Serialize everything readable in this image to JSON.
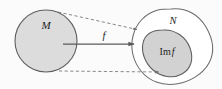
{
  "figure": {
    "background_color": "#fbfbfb",
    "labels": {
      "domain": "M",
      "codomain": "N",
      "map": "f",
      "image_prefix": "Im",
      "image_suffix": "f",
      "image_full": "Im f"
    },
    "colors": {
      "fill_gray": "#dcdcdc",
      "inner_fill_gray": "#d2d2d2",
      "stroke_dark": "#595959",
      "stroke_outline": "#6b6b6b",
      "dashed_stroke": "#7a7a7a",
      "arrow_stroke": "#5a5a5a",
      "text": "#1c1c1c"
    },
    "shapes": {
      "domain_circle": {
        "cx": 46,
        "cy": 41,
        "r": 31
      },
      "codomain_blob": "irregular-rounded-blob",
      "image_blob": "filled-inner-blob"
    },
    "connectors": {
      "solid_arrow": {
        "from_x": 63,
        "from_y": 44,
        "to_x": 136,
        "to_y": 44,
        "style": "solid"
      },
      "dashed_top": {
        "from_x": 58,
        "from_y": 12,
        "to_x": 139,
        "to_y": 30,
        "style": "dashed"
      },
      "dashed_bottom": {
        "from_x": 59,
        "from_y": 71,
        "to_x": 161,
        "to_y": 72,
        "style": "dashed"
      }
    }
  }
}
